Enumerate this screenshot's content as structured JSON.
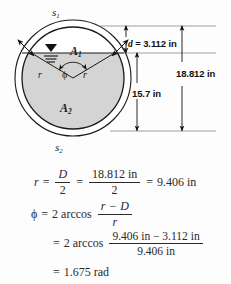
{
  "figure": {
    "name": "pipe-cross-section-diagram",
    "outer_arc_top_label": "s",
    "outer_arc_top_sub": "1",
    "outer_arc_bottom_label": "s",
    "outer_arc_bottom_sub": "2",
    "area_above_label": "A",
    "area_above_sub": "1",
    "area_below_label": "A",
    "area_below_sub": "2",
    "radius_label_left": "r",
    "radius_label_right": "r",
    "angle_label": "ϕ",
    "dimensions": {
      "depth_symbol": "d",
      "depth_equals": " = 3.112 in",
      "lower_span": "15.7 in",
      "total_diameter": "18.812 in"
    },
    "colors": {
      "shaded_area_fill": "#d4d4d4",
      "unshaded_area_fill": "#ffffff",
      "stroke": "#1a1a1a",
      "background": "#fdfdfd"
    }
  },
  "equations": {
    "eq1": {
      "lhs": "r",
      "eq_a": "=",
      "frac1_num": "D",
      "frac1_den": "2",
      "eq_b": "=",
      "frac2_num": "18.812 in",
      "frac2_den": "2",
      "eq_c": "=",
      "result": "9.406 in"
    },
    "eq2": {
      "lhs": "ϕ",
      "eq_a": "=",
      "coefficient": "2",
      "function": "arccos",
      "frac_num_a": "r",
      "frac_num_minus": "−",
      "frac_num_b": "D",
      "frac_den": "r"
    },
    "eq3": {
      "eq_a": "=",
      "coefficient": "2",
      "function": "arccos",
      "frac_num": "9.406 in − 3.112 in",
      "frac_den": "9.406 in"
    },
    "eq4": {
      "eq_a": "=",
      "result": "1.675 rad"
    }
  }
}
